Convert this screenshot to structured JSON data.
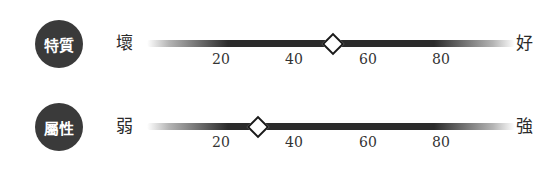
{
  "scales": [
    {
      "badge": "特質",
      "left_label": "壞",
      "right_label": "好",
      "value": 50,
      "ticks": [
        "20",
        "40",
        "60",
        "80"
      ]
    },
    {
      "badge": "屬性",
      "left_label": "弱",
      "right_label": "強",
      "value": 30,
      "ticks": [
        "20",
        "40",
        "60",
        "80"
      ]
    }
  ],
  "colors": {
    "badge_bg": "#3a3a3a",
    "bar": "#2b2b2b",
    "marker_fill": "#ffffff",
    "marker_border": "#1a1a1a"
  }
}
